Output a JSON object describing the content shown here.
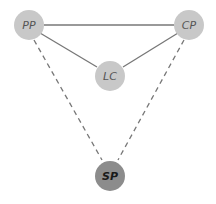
{
  "diagram": {
    "nodes": [
      {
        "id": "PP",
        "label": "PP",
        "cx": 29,
        "cy": 25,
        "r": 15,
        "fill": "#c8c8c8",
        "text_color": "#555555",
        "bold": false
      },
      {
        "id": "CP",
        "label": "CP",
        "cx": 189,
        "cy": 25,
        "r": 15,
        "fill": "#c8c8c8",
        "text_color": "#555555",
        "bold": false
      },
      {
        "id": "LC",
        "label": "LC",
        "cx": 110,
        "cy": 76,
        "r": 15,
        "fill": "#c8c8c8",
        "text_color": "#555555",
        "bold": false
      },
      {
        "id": "SP",
        "label": "SP",
        "cx": 110,
        "cy": 176,
        "r": 15,
        "fill": "#8c8c8c",
        "text_color": "#1a1a1a",
        "bold": true
      }
    ],
    "edges": [
      {
        "from": "PP",
        "to": "CP",
        "style": "solid"
      },
      {
        "from": "PP",
        "to": "LC",
        "style": "solid"
      },
      {
        "from": "CP",
        "to": "LC",
        "style": "solid"
      },
      {
        "from": "PP",
        "to": "SP",
        "style": "dashed"
      },
      {
        "from": "CP",
        "to": "SP",
        "style": "dashed"
      }
    ],
    "colors": {
      "edge": "#777777",
      "background": "#ffffff"
    }
  }
}
